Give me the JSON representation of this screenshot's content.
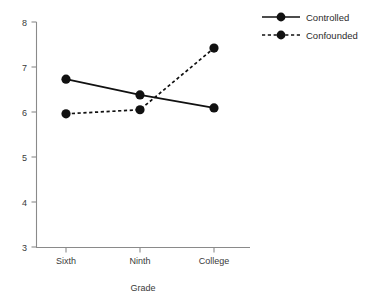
{
  "chart_data": {
    "type": "line",
    "title": "",
    "subtitle": "",
    "xlabel": "Grade",
    "ylabel": "",
    "categories": [
      "Sixth",
      "Ninth",
      "College"
    ],
    "series": [
      {
        "name": "Controlled",
        "style": "solid",
        "marker": "filled-circle",
        "values": [
          6.73,
          6.38,
          6.09
        ]
      },
      {
        "name": "Confounded",
        "style": "dashed",
        "marker": "filled-circle",
        "values": [
          5.96,
          6.05,
          7.42
        ]
      }
    ],
    "ylim": [
      3,
      8
    ],
    "yticks": [
      3,
      4,
      5,
      6,
      7,
      8
    ],
    "ytick_labels": [
      "3",
      "4",
      "5",
      "6",
      "7",
      "8"
    ],
    "xtick_labels": [
      "Sixth",
      "Ninth",
      "College"
    ],
    "grid": false,
    "legend_position": "top-right",
    "colors": {
      "line": "#111111",
      "marker": "#111111",
      "axis": "#8a8a8a",
      "text": "#3a3a3a"
    }
  },
  "axis": {
    "y_tick_3": "3",
    "y_tick_4": "4",
    "y_tick_5": "5",
    "y_tick_6": "6",
    "y_tick_7": "7",
    "y_tick_8": "8",
    "x_tick_sixth": "Sixth",
    "x_tick_ninth": "Ninth",
    "x_tick_college": "College",
    "x_title": "Grade"
  },
  "legend": {
    "entries": [
      {
        "label": "Controlled"
      },
      {
        "label": "Confounded"
      }
    ],
    "entry_0_label": "Controlled",
    "entry_1_label": "Confounded"
  }
}
